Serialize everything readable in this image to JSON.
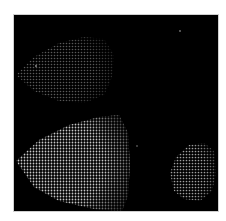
{
  "figure": {
    "background": "#000000",
    "page_background": "#ffffff",
    "blobs": [
      {
        "name": "upper-left-cluster",
        "brightness": "dim",
        "dot_color": "#5a5a5a",
        "points": "2,60 20,42 45,28 70,22 90,24 100,40 98,62 90,80 70,88 45,86 20,76"
      },
      {
        "name": "lower-left-cluster",
        "brightness": "bright",
        "dot_color": "#c8c8c8",
        "points": "2,146 25,125 55,110 85,102 105,100 114,118 116,150 114,180 108,196 80,194 45,186 20,172"
      },
      {
        "name": "lower-right-cluster",
        "brightness": "medium",
        "dot_color": "#a0a0a0",
        "points": "156,158 162,142 175,130 190,128 200,136 202,158 198,176 186,186 170,184 160,176"
      }
    ],
    "stray_points": [
      {
        "x": 180,
        "y": 31,
        "color": "#777777"
      },
      {
        "x": 36,
        "y": 66,
        "color": "#999999"
      },
      {
        "x": 137,
        "y": 146,
        "color": "#555555"
      }
    ]
  }
}
